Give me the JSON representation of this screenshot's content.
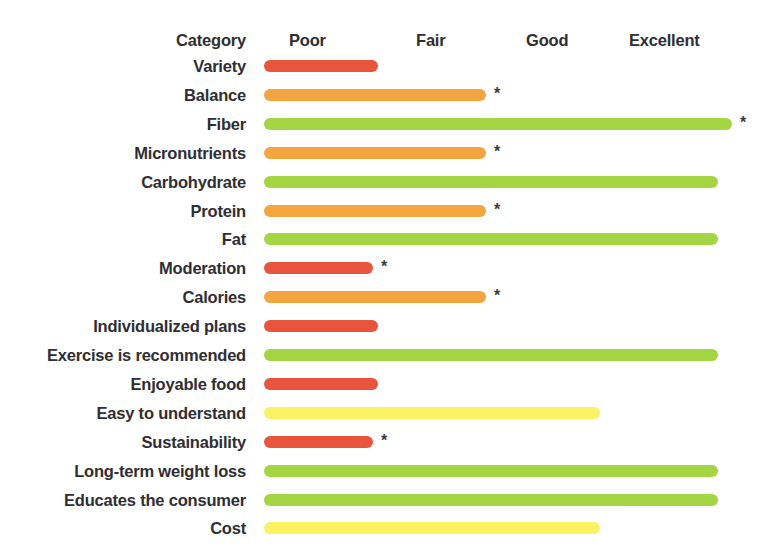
{
  "chart_data": {
    "type": "bar",
    "title": "",
    "subtitle": "",
    "xlabel": "",
    "ylabel": "Category",
    "grid": false,
    "legend": "none",
    "orientation": "horizontal",
    "scale_labels": [
      "Poor",
      "Fair",
      "Good",
      "Excellent"
    ],
    "scale_positions_px": [
      289,
      416,
      526,
      629
    ],
    "category_header": "Category",
    "xlim": [
      0,
      100
    ],
    "axis_note": "Rating scale runs Poor → Excellent left to right; bar length encodes rating.",
    "colors": {
      "poor": "#E8553C",
      "fair": "#F5A53F",
      "moderate": "#FAF263",
      "good": "#A4D644"
    },
    "asterisk_glyph": "*",
    "asterisk_note": "Asterisk marks rows flagged for additional comment.",
    "categories": [
      "Variety",
      "Balance",
      "Fiber",
      "Micronutrients",
      "Carbohydrate",
      "Protein",
      "Fat",
      "Moderation",
      "Calories",
      "Individualized plans",
      "Exercise is recommended",
      "Enjoyable food",
      "Easy to understand",
      "Sustainability",
      "Long-term weight loss",
      "Educates the consumer",
      "Cost"
    ],
    "values": [
      24,
      47,
      99,
      47,
      96,
      47,
      96,
      23,
      47,
      24,
      96,
      24,
      71,
      23,
      96,
      96,
      71
    ],
    "rows": [
      {
        "label": "Variety",
        "value": 24,
        "color": "#E8553C",
        "rating": "Poor",
        "asterisk": false
      },
      {
        "label": "Balance",
        "value": 47,
        "color": "#F5A53F",
        "rating": "Fair",
        "asterisk": true
      },
      {
        "label": "Fiber",
        "value": 99,
        "color": "#A4D644",
        "rating": "Excellent",
        "asterisk": true
      },
      {
        "label": "Micronutrients",
        "value": 47,
        "color": "#F5A53F",
        "rating": "Fair",
        "asterisk": true
      },
      {
        "label": "Carbohydrate",
        "value": 96,
        "color": "#A4D644",
        "rating": "Excellent",
        "asterisk": false
      },
      {
        "label": "Protein",
        "value": 47,
        "color": "#F5A53F",
        "rating": "Fair",
        "asterisk": true
      },
      {
        "label": "Fat",
        "value": 96,
        "color": "#A4D644",
        "rating": "Excellent",
        "asterisk": false
      },
      {
        "label": "Moderation",
        "value": 23,
        "color": "#E8553C",
        "rating": "Poor",
        "asterisk": true
      },
      {
        "label": "Calories",
        "value": 47,
        "color": "#F5A53F",
        "rating": "Fair",
        "asterisk": true
      },
      {
        "label": "Individualized plans",
        "value": 24,
        "color": "#E8553C",
        "rating": "Poor",
        "asterisk": false
      },
      {
        "label": "Exercise is recommended",
        "value": 96,
        "color": "#A4D644",
        "rating": "Excellent",
        "asterisk": false
      },
      {
        "label": "Enjoyable food",
        "value": 24,
        "color": "#E8553C",
        "rating": "Poor",
        "asterisk": false
      },
      {
        "label": "Easy to understand",
        "value": 71,
        "color": "#FAF263",
        "rating": "Good",
        "asterisk": false
      },
      {
        "label": "Sustainability",
        "value": 23,
        "color": "#E8553C",
        "rating": "Poor",
        "asterisk": true
      },
      {
        "label": "Long-term weight loss",
        "value": 96,
        "color": "#A4D644",
        "rating": "Excellent",
        "asterisk": false
      },
      {
        "label": "Educates the consumer",
        "value": 96,
        "color": "#A4D644",
        "rating": "Excellent",
        "asterisk": false
      },
      {
        "label": "Cost",
        "value": 71,
        "color": "#FAF263",
        "rating": "Good",
        "asterisk": false
      }
    ]
  }
}
